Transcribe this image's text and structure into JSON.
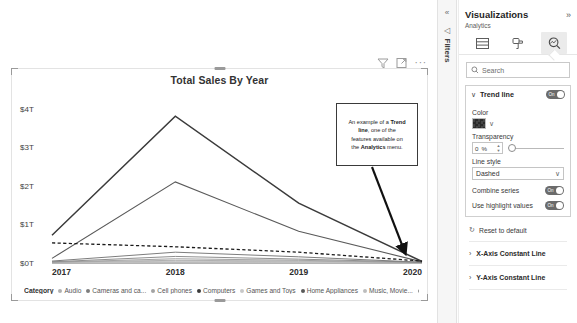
{
  "visual_header": {
    "filter_icon": "filter-icon",
    "focus_icon": "focus-mode-icon",
    "more_options": "···"
  },
  "chart_data": {
    "type": "line",
    "title": "Total Sales By Year",
    "xlabel": "",
    "ylabel": "",
    "grid": false,
    "legend_position": "bottom",
    "legend_title": "Category",
    "x": [
      "2017",
      "2018",
      "2019",
      "2020"
    ],
    "xtick_labels": [
      "2017",
      "2018",
      "2019",
      "2020"
    ],
    "ytick_labels": [
      "$0T",
      "$1T",
      "$2T",
      "$3T",
      "$4T"
    ],
    "ytick_values": [
      0,
      1,
      2,
      3,
      4
    ],
    "ylim": [
      0,
      4.35
    ],
    "yunit": "Trillions USD",
    "series": [
      {
        "name": "Computers",
        "values": [
          0.72,
          3.8,
          1.55,
          0.04
        ],
        "color": "#3b3b3b",
        "width": 1.5
      },
      {
        "name": "Home Appliances",
        "values": [
          0.12,
          2.1,
          0.82,
          0.03
        ],
        "color": "#5a5a5a",
        "width": 1.1
      },
      {
        "name": "Cameras and ca..",
        "values": [
          0.05,
          0.28,
          0.16,
          0.02
        ],
        "color": "#7d7d7d",
        "width": 1.0
      },
      {
        "name": "TV and Video",
        "values": [
          0.03,
          0.17,
          0.1,
          0.02
        ],
        "color": "#8f8f8f",
        "width": 1.0
      },
      {
        "name": "Cell phones",
        "values": [
          0.02,
          0.11,
          0.07,
          0.01
        ],
        "color": "#a3a3a3",
        "width": 1.0
      },
      {
        "name": "Audio",
        "values": [
          0.02,
          0.07,
          0.05,
          0.01
        ],
        "color": "#b0b0b0",
        "width": 1.0
      },
      {
        "name": "Music, Movie..",
        "values": [
          0.01,
          0.05,
          0.03,
          0.01
        ],
        "color": "#bdbdbd",
        "width": 1.0
      },
      {
        "name": "Games and Toys",
        "values": [
          0.01,
          0.03,
          0.02,
          0.01
        ],
        "color": "#c8c8c8",
        "width": 1.0
      }
    ],
    "trend_line": {
      "name": "Trend line",
      "style": "Dashed",
      "color": "#1a1a1a",
      "values": [
        0.52,
        0.42,
        0.28,
        0.05
      ]
    },
    "legend_items": [
      "Audio",
      "Cameras and ca...",
      "Cell phones",
      "Computers",
      "Games and Toys",
      "Home Appliances",
      "Music, Movie...",
      "TV and Video"
    ]
  },
  "callout": {
    "line1_a": "An example of a ",
    "line1_b": "Trend",
    "line2_a": "line",
    "line2_b": ", one of the",
    "line3": "features available on",
    "line4_a": "the ",
    "line4_b": "Analytics",
    "line4_c": " menu."
  },
  "filters_rail": {
    "collapse_icon": "«",
    "expand_icon": "◁",
    "label": "Filters"
  },
  "viz_pane": {
    "title": "Visualizations",
    "collapse_chevron": "»",
    "subtitle": "Analytics",
    "tabs": [
      {
        "name": "fields",
        "icon": "fields-icon",
        "active": false
      },
      {
        "name": "format",
        "icon": "paint-roller-icon",
        "active": false
      },
      {
        "name": "analytics",
        "icon": "magnifier-icon",
        "active": true
      }
    ],
    "search": {
      "placeholder": "Search",
      "value": "",
      "icon": "search-icon"
    },
    "trend_line_card": {
      "chevron": "∨",
      "label": "Trend line",
      "toggle_state": "On",
      "color_label": "Color",
      "color_value": "#2b2b2b",
      "color_chevron": "∨",
      "transparency_label": "Transparency",
      "transparency_value": "0",
      "transparency_unit": "%",
      "line_style_label": "Line style",
      "line_style_value": "Dashed",
      "line_style_chevron": "∨",
      "combine_series_label": "Combine series",
      "combine_series_state": "On",
      "use_highlight_label": "Use highlight values",
      "use_highlight_state": "On"
    },
    "reset": {
      "icon": "reset-icon",
      "label": "Reset to default"
    },
    "accordions": [
      {
        "chevron": "›",
        "label": "X-Axis Constant Line"
      },
      {
        "chevron": "›",
        "label": "Y-Axis Constant Line"
      }
    ]
  }
}
